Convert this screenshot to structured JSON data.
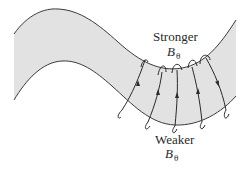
{
  "diagram": {
    "colors": {
      "tube_fill": "#e2e2e2",
      "tube_edge": "#3a3a3a",
      "field_line": "#2a2a2a",
      "background": "#ffffff"
    },
    "labels": {
      "top": {
        "text": "Stronger",
        "symbol": "B",
        "subscript": "θ"
      },
      "bottom": {
        "text": "Weaker",
        "symbol": "B",
        "subscript": "θ"
      }
    },
    "field_loops": [
      {
        "id": 1,
        "arrow": "up"
      },
      {
        "id": 2,
        "arrow": "up"
      },
      {
        "id": 3,
        "arrow": "up"
      },
      {
        "id": 4,
        "arrow": "up"
      },
      {
        "id": 5,
        "arrow": "up"
      }
    ]
  }
}
